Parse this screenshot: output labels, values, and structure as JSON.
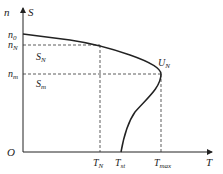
{
  "diagram": {
    "type": "mechanical-characteristic",
    "y_axis_label_n": "n",
    "y_axis_label_s": "S",
    "x_axis_label": "T",
    "origin_label": "O",
    "y_ticks": [
      {
        "base": "n",
        "sub": "0"
      },
      {
        "base": "n",
        "sub": "N"
      },
      {
        "base": "n",
        "sub": "m"
      }
    ],
    "x_ticks": [
      {
        "base": "T",
        "sub": "N"
      },
      {
        "base": "T",
        "sub": "st"
      },
      {
        "base": "T",
        "sub": "max"
      }
    ],
    "region_labels": [
      {
        "base": "S",
        "sub": "N"
      },
      {
        "base": "S",
        "sub": "m"
      }
    ],
    "point_label": {
      "base": "U",
      "sub": "N"
    }
  }
}
